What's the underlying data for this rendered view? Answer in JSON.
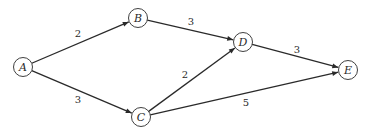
{
  "diagram": {
    "type": "directed-weighted-graph",
    "nodes": [
      {
        "id": "A",
        "label": "A"
      },
      {
        "id": "B",
        "label": "B"
      },
      {
        "id": "C",
        "label": "C"
      },
      {
        "id": "D",
        "label": "D"
      },
      {
        "id": "E",
        "label": "E"
      }
    ],
    "edges": [
      {
        "from": "A",
        "to": "B",
        "weight": "2"
      },
      {
        "from": "A",
        "to": "C",
        "weight": "3"
      },
      {
        "from": "B",
        "to": "D",
        "weight": "3"
      },
      {
        "from": "C",
        "to": "D",
        "weight": "2"
      },
      {
        "from": "D",
        "to": "E",
        "weight": "3"
      },
      {
        "from": "C",
        "to": "E",
        "weight": "5"
      }
    ],
    "colors": {
      "stroke": "#2a2a2a",
      "background": "#ffffff"
    }
  }
}
